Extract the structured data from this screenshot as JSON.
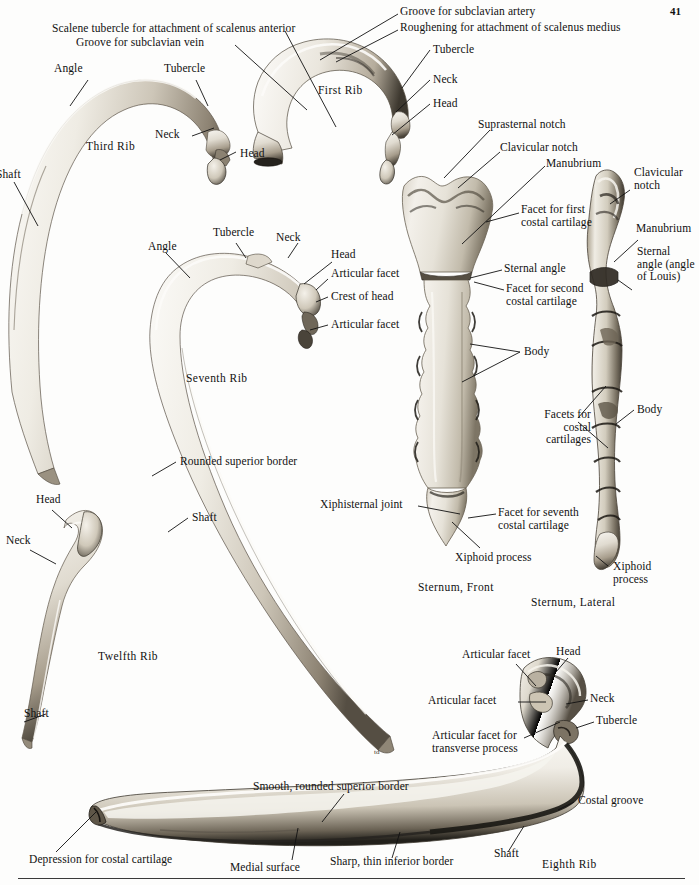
{
  "page": {
    "folio": "41"
  },
  "figures": [
    {
      "id": "first-rib",
      "caption": "First Rib"
    },
    {
      "id": "third-rib",
      "caption": "Third Rib"
    },
    {
      "id": "seventh-rib",
      "caption": "Seventh Rib"
    },
    {
      "id": "twelfth-rib",
      "caption": "Twelfth Rib"
    },
    {
      "id": "sternum-front",
      "caption": "Sternum, Front"
    },
    {
      "id": "sternum-lateral",
      "caption": "Sternum, Lateral"
    },
    {
      "id": "eighth-rib",
      "caption": "Eighth Rib"
    }
  ],
  "labels": {
    "first_rib": [
      "Groove for subclavian artery",
      "Roughening for attachment of scalenus medius",
      "Scalene tubercle for attachment of scalenus anterior",
      "Groove for subclavian vein",
      "Tubercle",
      "Neck",
      "Head"
    ],
    "third_rib": [
      "Angle",
      "Tubercle",
      "Neck",
      "Head",
      "Shaft"
    ],
    "seventh_rib": [
      "Angle",
      "Tubercle",
      "Neck",
      "Head",
      "Articular facet",
      "Crest of head",
      "Articular facet",
      "Rounded superior border",
      "Shaft"
    ],
    "twelfth_rib": [
      "Head",
      "Neck",
      "Shaft"
    ],
    "sternum_front": [
      "Suprasternal notch",
      "Clavicular notch",
      "Manubrium",
      "Facet\nfor first\ncostal\ncartilage",
      "Sternal angle",
      "Facet for\nsecond costal\ncartilage",
      "Body",
      "Xiphisternal joint",
      "Facet for\nseventh costal\ncartilage",
      "Xiphoid process"
    ],
    "sternum_lateral": [
      "Clavicular\nnotch",
      "Manubrium",
      "Sternal\nangle\n(angle of\nLouis)",
      "Facets for\ncostal\ncartilages",
      "Body",
      "Xiphoid\nprocess"
    ],
    "eighth_rib": [
      "Articular facet",
      "Head",
      "Articular facet",
      "Neck",
      "Articular facet for\ntransverse process",
      "Tubercle",
      "Smooth, rounded superior border",
      "Costal groove",
      "Depression for costal cartilage",
      "Medial surface",
      "Sharp, thin inferior border",
      "Shaft"
    ]
  },
  "text": {
    "groove_subclavian_artery": "Groove for subclavian artery",
    "roughening_scalenus_medius": "Roughening for attachment of scalenus medius",
    "scalene_tubercle": "Scalene tubercle for attachment of scalenus anterior",
    "groove_subclavian_vein": "Groove for subclavian vein",
    "first_rib_caption": "First Rib",
    "tubercle": "Tubercle",
    "neck": "Neck",
    "head": "Head",
    "angle": "Angle",
    "shaft": "Shaft",
    "third_rib_caption": "Third Rib",
    "seventh_rib_caption": "Seventh Rib",
    "twelfth_rib_caption": "Twelfth Rib",
    "articular_facet": "Articular facet",
    "crest_of_head": "Crest of head",
    "rounded_superior_border": "Rounded superior border",
    "suprasternal_notch": "Suprasternal notch",
    "clavicular_notch": "Clavicular notch",
    "clavicular_notch_2l": "Clavicular\nnotch",
    "manubrium": "Manubrium",
    "facet_first_costal": "Facet\nfor first\ncostal\ncartilage",
    "sternal_angle": "Sternal angle",
    "facet_second_costal": "Facet for\nsecond costal\ncartilage",
    "body": "Body",
    "facets_costal_cartilages": "Facets for\ncostal\ncartilages",
    "sternal_angle_louis": "Sternal\nangle\n(angle of\nLouis)",
    "xiphisternal_joint": "Xiphisternal joint",
    "facet_seventh_costal": "Facet for\nseventh costal\ncartilage",
    "xiphoid_process": "Xiphoid process",
    "xiphoid_process_2l": "Xiphoid\nprocess",
    "sternum_front_caption": "Sternum, Front",
    "sternum_lateral_caption": "Sternum, Lateral",
    "articular_facet_transverse": "Articular facet for\ntransverse process",
    "smooth_rounded_superior_border": "Smooth, rounded superior border",
    "costal_groove": "Costal groove",
    "depression_costal_cartilage": "Depression for costal cartilage",
    "medial_surface": "Medial surface",
    "sharp_thin_inferior_border": "Sharp, thin inferior border",
    "eighth_rib_caption": "Eighth Rib"
  },
  "colors": {
    "page_background": "#fdfdfc",
    "ink": "#111111",
    "bone_light": "#f2efe9",
    "bone_mid": "#c9c3b8",
    "bone_dark": "#6e6558",
    "bone_shadow": "#2e2a24",
    "rule": "#3a3a3a"
  }
}
